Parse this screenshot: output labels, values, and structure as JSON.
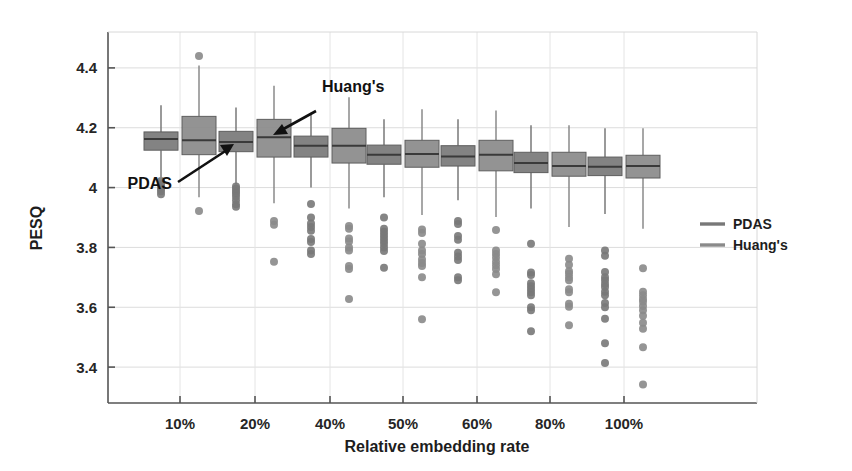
{
  "chart_data": {
    "type": "box",
    "title": "",
    "xlabel": "Relative embedding rate",
    "ylabel": "PESQ",
    "categories": [
      "10%",
      "20%",
      "40%",
      "50%",
      "60%",
      "80%",
      "100%"
    ],
    "ytick_labels": [
      "3.4",
      "3.6",
      "3.8",
      "4",
      "4.2",
      "4.4"
    ],
    "ytick_values": [
      3.4,
      3.6,
      3.8,
      4.0,
      4.2,
      4.4
    ],
    "ylim": [
      3.28,
      4.52
    ],
    "grid": true,
    "legend_position": "right",
    "legend": [
      {
        "name": "PDAS",
        "color": "#7a7a7a"
      },
      {
        "name": "Huang's",
        "color": "#8c8c8c"
      }
    ],
    "annotations": [
      {
        "text": "PDAS",
        "points_to": "20% PDAS box"
      },
      {
        "text": "Huang's",
        "points_to": "20% Huang's box"
      }
    ],
    "series": [
      {
        "name": "PDAS",
        "color": "#787878",
        "boxes": [
          {
            "category": "10%",
            "q1": 4.125,
            "median": 4.162,
            "q3": 4.186,
            "whisker_low": 4.035,
            "whisker_high": 4.275,
            "outliers": [
              4.022,
              4.012,
              4.004,
              3.996,
              3.988,
              3.978
            ]
          },
          {
            "category": "20%",
            "q1": 4.12,
            "median": 4.152,
            "q3": 4.188,
            "whisker_low": 4.01,
            "whisker_high": 4.268,
            "outliers": [
              4.004,
              3.996,
              3.988,
              3.98,
              3.97,
              3.958,
              3.944,
              3.936
            ]
          },
          {
            "category": "40%",
            "q1": 4.102,
            "median": 4.14,
            "q3": 4.172,
            "whisker_low": 4.0,
            "whisker_high": 4.25,
            "outliers": [
              3.945,
              3.9,
              3.88,
              3.868,
              3.856,
              3.828,
              3.818,
              3.79,
              3.778
            ]
          },
          {
            "category": "50%",
            "q1": 4.078,
            "median": 4.11,
            "q3": 4.142,
            "whisker_low": 3.968,
            "whisker_high": 4.228,
            "outliers": [
              3.9,
              3.862,
              3.852,
              3.842,
              3.832,
              3.822,
              3.812,
              3.8,
              3.788,
              3.732
            ]
          },
          {
            "category": "60%",
            "q1": 4.072,
            "median": 4.104,
            "q3": 4.14,
            "whisker_low": 3.958,
            "whisker_high": 4.228,
            "outliers": [
              3.888,
              3.878,
              3.838,
              3.826,
              3.782,
              3.77,
              3.758,
              3.7,
              3.69
            ]
          },
          {
            "category": "80%",
            "q1": 4.05,
            "median": 4.082,
            "q3": 4.118,
            "whisker_low": 3.93,
            "whisker_high": 4.208,
            "outliers": [
              3.812,
              3.716,
              3.708,
              3.68,
              3.67,
              3.66,
              3.65,
              3.64,
              3.6,
              3.59,
              3.52
            ]
          },
          {
            "category": "100%",
            "q1": 4.04,
            "median": 4.07,
            "q3": 4.102,
            "whisker_low": 3.912,
            "whisker_high": 4.198,
            "outliers": [
              3.79,
              3.772,
              3.718,
              3.7,
              3.69,
              3.678,
              3.668,
              3.652,
              3.64,
              3.614,
              3.6,
              3.562,
              3.48,
              3.414
            ]
          }
        ]
      },
      {
        "name": "Huang's",
        "color": "#8a8a8a",
        "boxes": [
          {
            "category": "10%",
            "q1": 4.11,
            "median": 4.158,
            "q3": 4.238,
            "whisker_low": 3.968,
            "whisker_high": 4.408,
            "outliers": [
              4.44,
              3.922
            ]
          },
          {
            "category": "20%",
            "q1": 4.102,
            "median": 4.168,
            "q3": 4.228,
            "whisker_low": 3.948,
            "whisker_high": 4.34,
            "outliers": [
              3.888,
              3.876,
              3.752
            ]
          },
          {
            "category": "40%",
            "q1": 4.082,
            "median": 4.14,
            "q3": 4.198,
            "whisker_low": 3.93,
            "whisker_high": 4.302,
            "outliers": [
              3.872,
              3.862,
              3.83,
              3.82,
              3.8,
              3.79,
              3.738,
              3.728,
              3.628
            ]
          },
          {
            "category": "50%",
            "q1": 4.068,
            "median": 4.112,
            "q3": 4.158,
            "whisker_low": 3.908,
            "whisker_high": 4.262,
            "outliers": [
              3.86,
              3.848,
              3.812,
              3.79,
              3.778,
              3.76,
              3.748,
              3.738,
              3.7,
              3.56
            ]
          },
          {
            "category": "60%",
            "q1": 4.056,
            "median": 4.11,
            "q3": 4.158,
            "whisker_low": 3.902,
            "whisker_high": 4.258,
            "outliers": [
              3.858,
              3.79,
              3.778,
              3.766,
              3.752,
              3.74,
              3.728,
              3.71,
              3.65
            ]
          },
          {
            "category": "80%",
            "q1": 4.038,
            "median": 4.072,
            "q3": 4.118,
            "whisker_low": 3.868,
            "whisker_high": 4.208,
            "outliers": [
              3.762,
              3.742,
              3.72,
              3.712,
              3.7,
              3.69,
              3.66,
              3.65,
              3.612,
              3.602,
              3.54
            ]
          },
          {
            "category": "100%",
            "q1": 4.032,
            "median": 4.072,
            "q3": 4.108,
            "whisker_low": 3.862,
            "whisker_high": 4.198,
            "outliers": [
              3.73,
              3.652,
              3.64,
              3.628,
              3.618,
              3.604,
              3.59,
              3.572,
              3.548,
              3.528,
              3.466,
              3.342
            ]
          }
        ]
      }
    ]
  },
  "axis": {
    "ylabel": "PESQ",
    "xlabel": "Relative embedding rate"
  }
}
